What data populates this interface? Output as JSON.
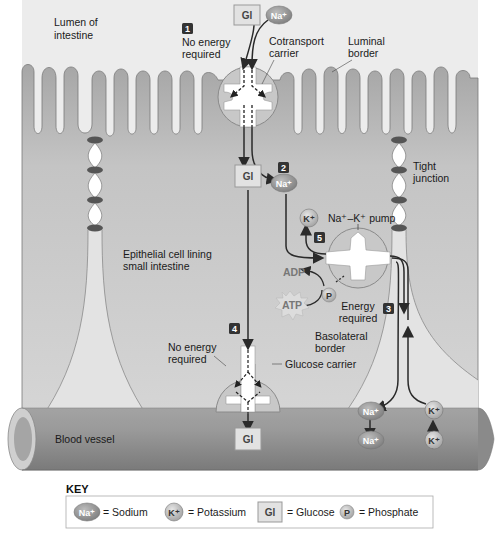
{
  "labels": {
    "lumen": [
      "Lumen of",
      "intestine"
    ],
    "step1_text": [
      "No energy",
      "required"
    ],
    "cotransport": [
      "Cotransport",
      "carrier"
    ],
    "luminal": [
      "Luminal",
      "border"
    ],
    "tight_junction": [
      "Tight",
      "junction"
    ],
    "epithelial": [
      "Epithelial cell lining",
      "small intestine"
    ],
    "pump": "Na⁺–K⁺ pump",
    "energy_required": [
      "Energy",
      "required"
    ],
    "basolateral": [
      "Basolateral",
      "border"
    ],
    "step4_text": [
      "No energy",
      "required"
    ],
    "glucose_carrier": "Glucose carrier",
    "blood_vessel": "Blood vessel",
    "adp": "ADP",
    "atp": "ATP"
  },
  "steps": [
    "1",
    "2",
    "3",
    "4",
    "5"
  ],
  "ions": {
    "na": "Na⁺",
    "k": "K⁺",
    "gl": "Gl",
    "p": "P"
  },
  "key": {
    "title": "KEY",
    "items": [
      {
        "symbol": "Na⁺",
        "label": "= Sodium"
      },
      {
        "symbol": "K⁺",
        "label": "= Potassium"
      },
      {
        "symbol": "Gl",
        "label": "= Glucose"
      },
      {
        "symbol": "P",
        "label": "= Phosphate"
      }
    ]
  },
  "colors": {
    "cell": "#a9a9a9",
    "cell_light": "#d6d6d6",
    "lumen_bg": "#ededed",
    "vessel": "#8f8f8f",
    "arrow": "#2a2a2a",
    "step_badge": "#333333"
  }
}
